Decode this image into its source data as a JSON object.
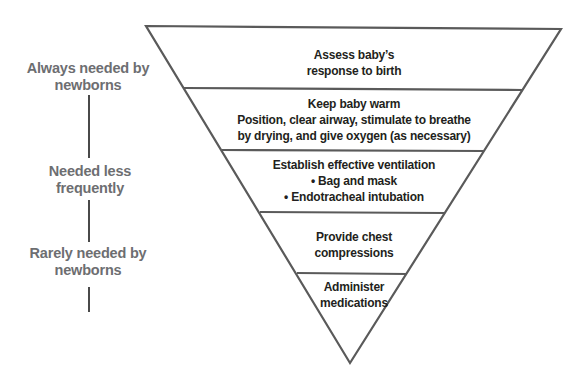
{
  "side_labels": [
    {
      "line1": "Always needed by",
      "line2": "newborns"
    },
    {
      "line1": "Needed less",
      "line2": "frequently"
    },
    {
      "line1": "Rarely needed by",
      "line2": "newborns"
    }
  ],
  "tiers": [
    {
      "lines": [
        "Assess baby’s",
        "response to birth"
      ]
    },
    {
      "lines": [
        "Keep baby warm",
        "Position, clear airway, stimulate to breathe",
        "by drying, and give oxygen (as necessary)"
      ]
    },
    {
      "lines": [
        "Establish effective ventilation",
        "• Bag and mask",
        "• Endotracheal intubation"
      ]
    },
    {
      "lines": [
        "Provide chest",
        "compressions"
      ]
    },
    {
      "lines": [
        "Administer",
        "medications"
      ]
    }
  ],
  "colors": {
    "outline": "#5a5a5a",
    "label_text": "#6d6e71",
    "tier_text": "#231f20"
  }
}
